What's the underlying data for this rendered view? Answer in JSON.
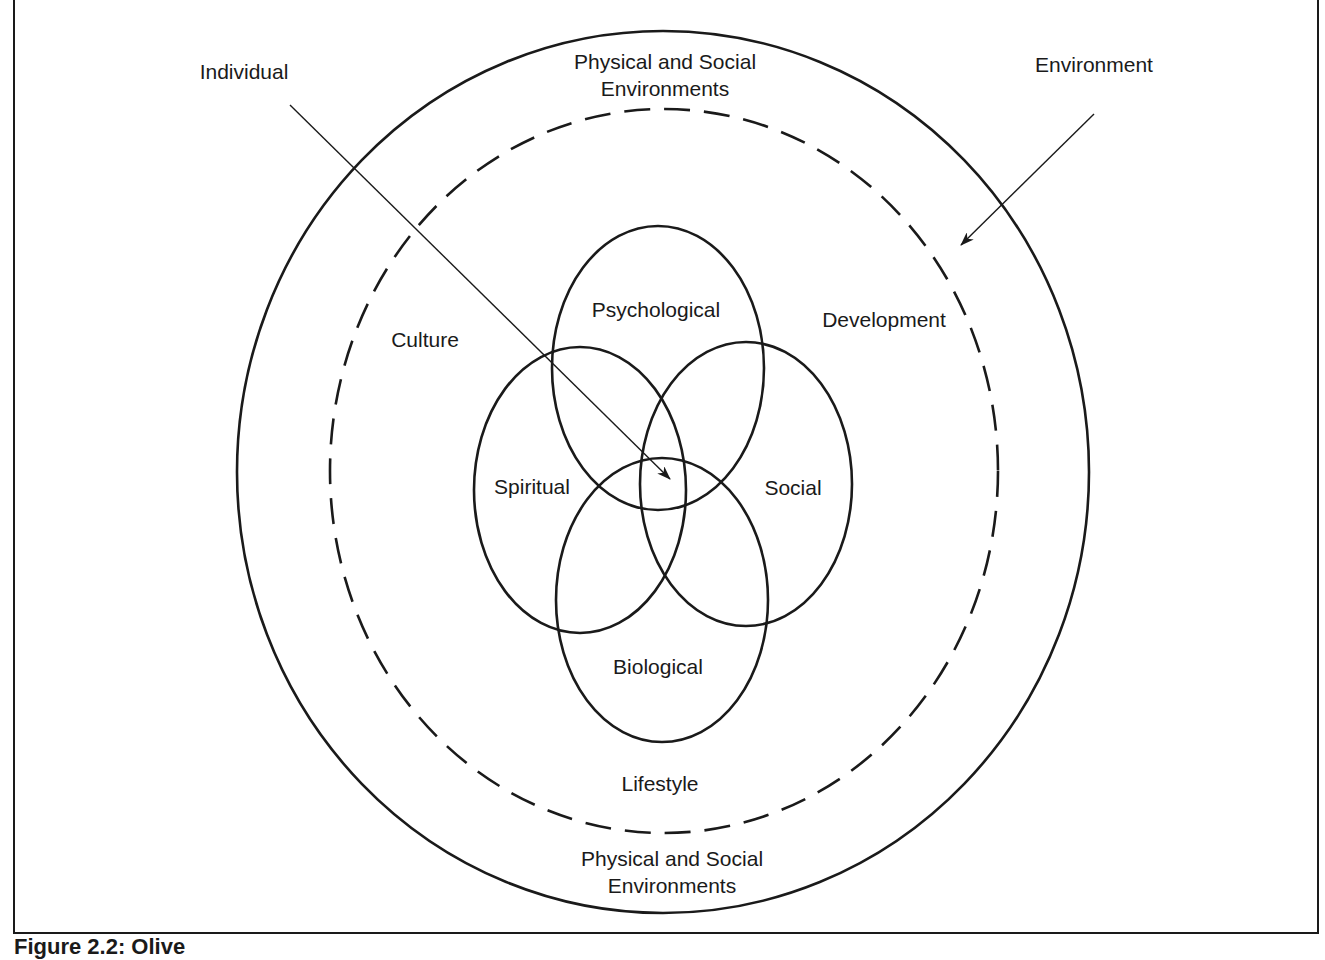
{
  "figure": {
    "caption": "Figure 2.2: Olive"
  },
  "labels": {
    "individual": "Individual",
    "environment": "Environment",
    "physical_social_top_1": "Physical and Social",
    "physical_social_top_2": "Environments",
    "physical_social_bottom_1": "Physical and Social",
    "physical_social_bottom_2": "Environments",
    "culture": "Culture",
    "development": "Development",
    "lifestyle": "Lifestyle",
    "psychological": "Psychological",
    "spiritual": "Spiritual",
    "social": "Social",
    "biological": "Biological"
  },
  "colors": {
    "stroke": "#1a1a1a",
    "background": "#ffffff"
  }
}
